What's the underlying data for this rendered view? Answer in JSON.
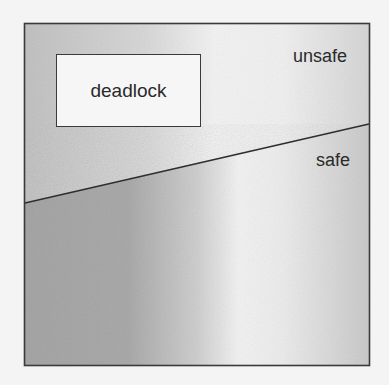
{
  "diagram": {
    "type": "region-diagram",
    "regions": [
      {
        "id": "unsafe",
        "label": "unsafe"
      },
      {
        "id": "safe",
        "label": "safe"
      },
      {
        "id": "deadlock",
        "label": "deadlock"
      }
    ],
    "labels": {
      "unsafe": "unsafe",
      "safe": "safe",
      "deadlock": "deadlock"
    },
    "colors": {
      "page_background": "#f4f4f4",
      "border": "#3a3a3a",
      "dark_shade": "#a8a8a8",
      "light_band": "#f2f2f2",
      "upper_left_shade": "#c4c4c4",
      "deadlock_fill": "#f6f6f6",
      "text": "#2a2a2a"
    }
  }
}
